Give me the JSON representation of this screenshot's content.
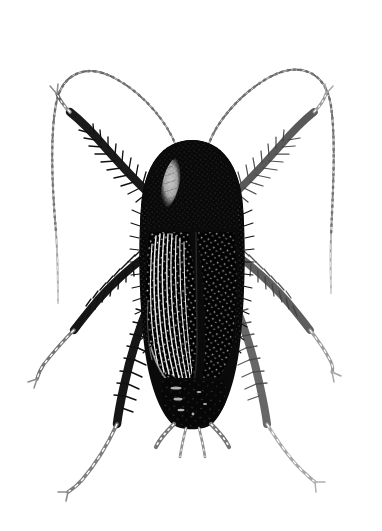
{
  "figure": {
    "domain": "Natural-Image",
    "kind": "scientific-line-illustration",
    "common_name": "Oriental cockroach",
    "orientation": "dorsal, head up",
    "technique": "stipple and line engraving, black ink on white",
    "caption": "",
    "title": "",
    "label": "",
    "credit": ""
  },
  "canvas": {
    "width": 382,
    "height": 531,
    "background_color": "#ffffff",
    "ink_color": "#111111",
    "mid_ink_color": "#6b6b6b",
    "light_ink_color": "#9a9a9a",
    "highlight_color": "#f2f2f2"
  },
  "anatomy": {
    "parts": [
      {
        "name": "head",
        "visible": false,
        "note": "concealed beneath pronotum"
      },
      {
        "name": "pronotum",
        "visible": true,
        "note": "broad shield with pale crescent highlight at left"
      },
      {
        "name": "tegmina",
        "visible": true,
        "note": "leathery forewings with longitudinal venation striations"
      },
      {
        "name": "abdomen",
        "visible": true,
        "note": "tapering, segmented, stippled"
      },
      {
        "name": "antennae",
        "visible": true,
        "count": 2,
        "note": "long, filiform, finely segmented, arching outward"
      },
      {
        "name": "legs",
        "visible": true,
        "count": 6,
        "note": "spinose femora and tibiae, pale segmented tarsi"
      },
      {
        "name": "cerci",
        "visible": true,
        "count": 2,
        "note": "short pale segmented appendages at abdomen apex"
      },
      {
        "name": "styli",
        "visible": true,
        "count": 2,
        "note": "slender pale processes between cerci"
      }
    ],
    "highlight_patch": {
      "location": "left anterior pronotum",
      "color": "#f2f2f2"
    }
  },
  "geometry": {
    "body_axis_x": 192,
    "body_top_y": 140,
    "body_bottom_y": 425,
    "body_max_half_width": 52,
    "antenna_left_tip": [
      58,
      303
    ],
    "antenna_right_tip": [
      331,
      293
    ],
    "leg_tip_front_left": [
      56,
      92
    ],
    "leg_tip_front_right": [
      322,
      96
    ],
    "leg_tip_mid_left": [
      37,
      379
    ],
    "leg_tip_mid_right": [
      332,
      372
    ],
    "leg_tip_hind_left": [
      68,
      492
    ],
    "leg_tip_hind_right": [
      315,
      482
    ]
  },
  "accessibility": {
    "alt_text": "Black and white stippled scientific illustration of a cockroach seen from above, with two long arching antennae, six spiny legs, leathery forewings showing fine venation, and two short cerci at the tip of the abdomen."
  }
}
